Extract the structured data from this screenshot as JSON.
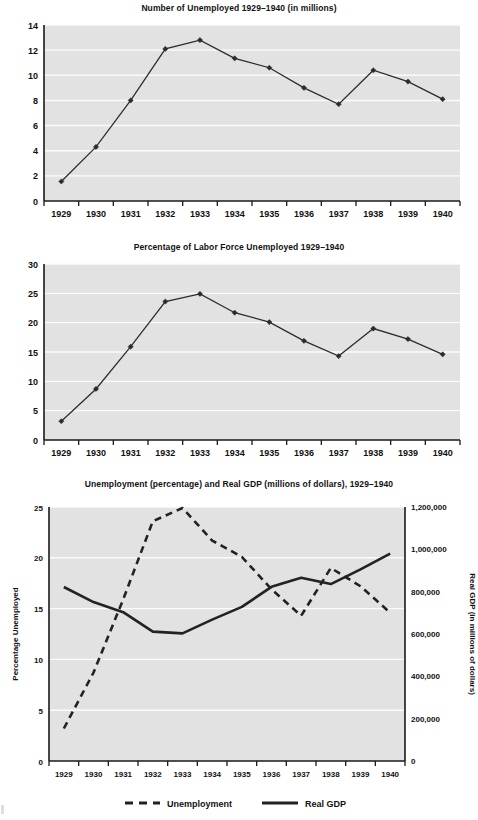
{
  "page": {
    "background": "#ffffff",
    "plot_area_color": "#e2e2e2",
    "gridline_color": "#fbfbfb",
    "line_color": "#2b2b2b"
  },
  "charts": [
    {
      "id": "unemployed-millions",
      "title": "Number of Unemployed 1929–1940 (in millions)",
      "ylabel": "",
      "xlabel": ""
    },
    {
      "id": "percent-labor-force",
      "title": "Percentage of Labor Force Unemployed 1929–1940",
      "ylabel": "",
      "xlabel": ""
    },
    {
      "id": "unemployment-and-gdp",
      "title": "Unemployment (percentage) and Real GDP (millions of dollars), 1929–1940",
      "ylabel_left": "Percentage Unemployed",
      "ylabel_right": "Real GDP (in millions of dollars)",
      "legend": [
        {
          "label": "Unemployment",
          "style": "dashed"
        },
        {
          "label": "Real GDP",
          "style": "solid"
        }
      ]
    }
  ],
  "chart_data": [
    {
      "type": "line",
      "title": "Number of Unemployed 1929–1940 (in millions)",
      "xlabel": "",
      "ylabel": "",
      "grid": true,
      "legend_position": "none",
      "categories": [
        "1929",
        "1930",
        "1931",
        "1932",
        "1933",
        "1934",
        "1935",
        "1936",
        "1937",
        "1938",
        "1939",
        "1940"
      ],
      "x": [
        1929,
        1930,
        1931,
        1932,
        1933,
        1934,
        1935,
        1936,
        1937,
        1938,
        1939,
        1940
      ],
      "values": [
        1.55,
        4.3,
        8.0,
        12.1,
        12.8,
        11.35,
        10.6,
        9.0,
        7.7,
        10.4,
        9.5,
        8.1
      ],
      "ylim": [
        0,
        14
      ],
      "yticks": [
        0,
        2,
        4,
        6,
        8,
        10,
        12,
        14
      ],
      "markers": true
    },
    {
      "type": "line",
      "title": "Percentage of Labor Force Unemployed 1929–1940",
      "xlabel": "",
      "ylabel": "",
      "grid": true,
      "legend_position": "none",
      "categories": [
        "1929",
        "1930",
        "1931",
        "1932",
        "1933",
        "1934",
        "1935",
        "1936",
        "1937",
        "1938",
        "1939",
        "1940"
      ],
      "x": [
        1929,
        1930,
        1931,
        1932,
        1933,
        1934,
        1935,
        1936,
        1937,
        1938,
        1939,
        1940
      ],
      "values": [
        3.2,
        8.7,
        15.9,
        23.6,
        24.9,
        21.7,
        20.1,
        16.9,
        14.3,
        19.0,
        17.2,
        14.6
      ],
      "ylim": [
        0,
        30
      ],
      "yticks": [
        0,
        5,
        10,
        15,
        20,
        25,
        30
      ],
      "markers": true
    },
    {
      "type": "line",
      "title": "Unemployment (percentage) and Real GDP (millions of dollars), 1929–1940",
      "xlabel": "",
      "ylabel": "Percentage Unemployed",
      "ylabel_right": "Real GDP (in millions of dollars)",
      "grid": true,
      "legend_position": "bottom",
      "categories": [
        "1929",
        "1930",
        "1931",
        "1932",
        "1933",
        "1934",
        "1935",
        "1936",
        "1937",
        "1938",
        "1939",
        "1940"
      ],
      "x": [
        1929,
        1930,
        1931,
        1932,
        1933,
        1934,
        1935,
        1936,
        1937,
        1938,
        1939,
        1940
      ],
      "series": [
        {
          "name": "Unemployment",
          "axis": "left",
          "style": "dashed",
          "values": [
            3.2,
            8.7,
            15.9,
            23.6,
            24.9,
            21.7,
            20.1,
            16.9,
            14.3,
            19.0,
            17.2,
            14.6
          ]
        },
        {
          "name": "Real GDP",
          "axis": "right",
          "style": "solid",
          "values": [
            822000,
            751000,
            703000,
            611000,
            603000,
            668000,
            728000,
            823000,
            866000,
            836000,
            905000,
            980000
          ]
        }
      ],
      "ylim": [
        0,
        25
      ],
      "yticks": [
        0,
        5,
        10,
        15,
        20,
        25
      ],
      "ylim_right": [
        0,
        1200000
      ],
      "yticks_right": [
        0,
        200000,
        400000,
        600000,
        800000,
        1000000,
        1200000
      ],
      "ytick_labels_right": [
        "0",
        "200,000",
        "400,000",
        "600,000",
        "800,000",
        "1,000,000",
        "1,200,000"
      ]
    }
  ]
}
